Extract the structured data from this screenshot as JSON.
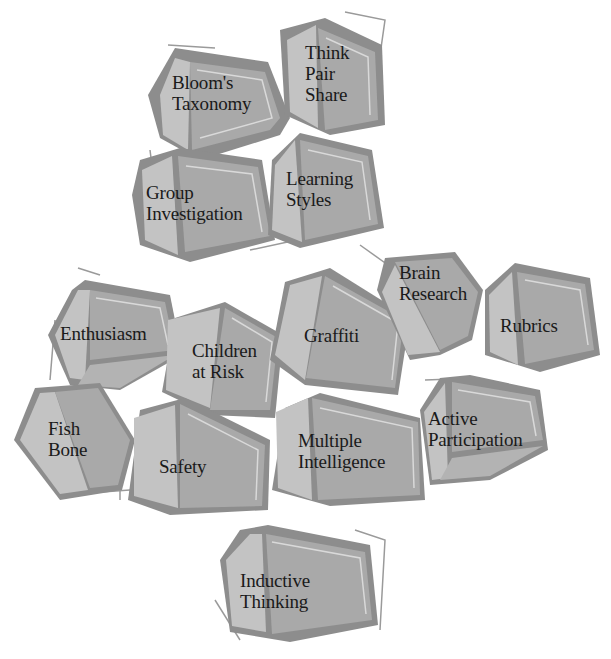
{
  "colors": {
    "background": "#ffffff",
    "block_outline": "#888888",
    "block_front": "#a9a9a9",
    "block_side": "#c3c3c3",
    "block_highlight": "#d9d9d9",
    "shadow_line": "#9a9a9a",
    "text": "#1a1a1a"
  },
  "blocks": [
    {
      "id": "blooms",
      "lines": [
        "Bloom's",
        "Taxonomy"
      ]
    },
    {
      "id": "tps",
      "lines": [
        "Think",
        "Pair",
        "Share"
      ]
    },
    {
      "id": "group",
      "lines": [
        "Group",
        "Investigation"
      ]
    },
    {
      "id": "learning",
      "lines": [
        "Learning",
        "Styles"
      ]
    },
    {
      "id": "enthusiasm",
      "lines": [
        "Enthusiasm"
      ]
    },
    {
      "id": "children",
      "lines": [
        "Children",
        "at Risk"
      ]
    },
    {
      "id": "graffiti",
      "lines": [
        "Graffiti"
      ]
    },
    {
      "id": "brain",
      "lines": [
        "Brain",
        "Research"
      ]
    },
    {
      "id": "rubrics",
      "lines": [
        "Rubrics"
      ]
    },
    {
      "id": "fish",
      "lines": [
        "Fish",
        "Bone"
      ]
    },
    {
      "id": "safety",
      "lines": [
        "Safety"
      ]
    },
    {
      "id": "mi",
      "lines": [
        "Multiple",
        "Intelligence"
      ]
    },
    {
      "id": "active",
      "lines": [
        "Active",
        "Participation"
      ]
    },
    {
      "id": "inductive",
      "lines": [
        "Inductive",
        "Thinking"
      ]
    }
  ]
}
